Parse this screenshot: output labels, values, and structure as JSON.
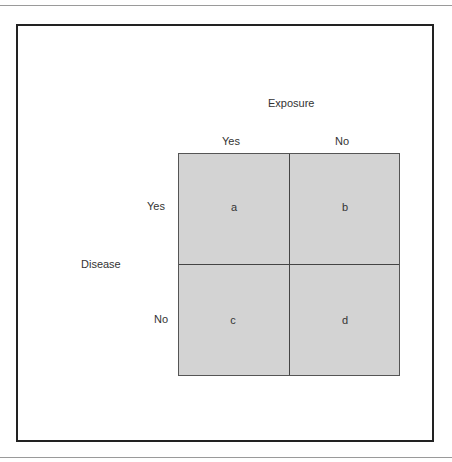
{
  "diagram": {
    "title": "Exposure",
    "column_headers": [
      "Yes",
      "No"
    ],
    "row_axis_label": "Disease",
    "row_headers": [
      "Yes",
      "No"
    ],
    "cells": [
      [
        "a",
        "b"
      ],
      [
        "c",
        "d"
      ]
    ],
    "colors": {
      "cell_fill": "#d3d3d3",
      "grid_line": "#444444",
      "frame": "#222222",
      "rule": "#9a9a9a"
    }
  }
}
